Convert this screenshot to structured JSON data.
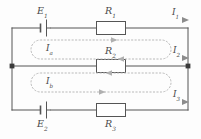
{
  "figure": {
    "name": "two-mesh-dc-circuit",
    "background_color": "#fdfdfd",
    "wire_color": "#555555",
    "dotted_loop_color": "#b9b9b9",
    "label_color": "#4a4a4a",
    "component_fill": "#ffffff"
  },
  "sources": [
    {
      "id": "E1",
      "symbol": "E",
      "subscript": "1",
      "position": "top-left-branch",
      "orientation": "vertical-plates",
      "label_position": "above"
    },
    {
      "id": "E2",
      "symbol": "E",
      "subscript": "2",
      "position": "bottom-left-branch",
      "orientation": "vertical-plates",
      "label_position": "below"
    }
  ],
  "resistors": [
    {
      "id": "R1",
      "symbol": "R",
      "subscript": "1",
      "position": "top-branch",
      "label_position": "above"
    },
    {
      "id": "R2",
      "symbol": "R",
      "subscript": "2",
      "position": "middle-branch",
      "label_position": "above"
    },
    {
      "id": "R3",
      "symbol": "R",
      "subscript": "3",
      "position": "bottom-branch",
      "label_position": "below"
    }
  ],
  "branch_currents": [
    {
      "id": "I1",
      "symbol": "I",
      "subscript": "1",
      "position": "top-right",
      "arrow": "right"
    },
    {
      "id": "I2",
      "symbol": "I",
      "subscript": "2",
      "position": "middle-right",
      "arrow": "right"
    },
    {
      "id": "I3",
      "symbol": "I",
      "subscript": "3",
      "position": "bottom-right",
      "arrow": "right"
    }
  ],
  "mesh_currents": [
    {
      "id": "Ia",
      "symbol": "I",
      "subscript": "a",
      "position": "upper-mesh",
      "direction": "clockwise"
    },
    {
      "id": "Ib",
      "symbol": "I",
      "subscript": "b",
      "position": "lower-mesh",
      "direction": "clockwise"
    }
  ],
  "nodes": [
    {
      "id": "node-left",
      "x": 12,
      "y": 66
    },
    {
      "id": "node-right",
      "x": 188,
      "y": 66
    }
  ]
}
